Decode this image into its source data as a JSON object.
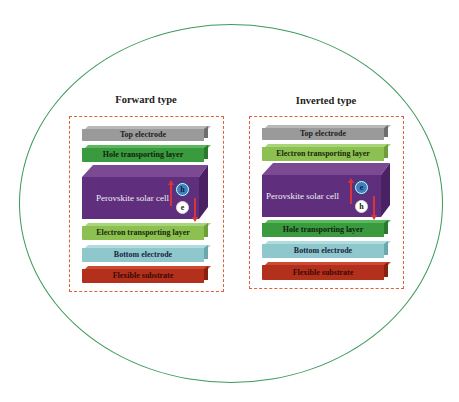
{
  "diagram": {
    "columns": [
      {
        "title": "Forward type",
        "layers": [
          {
            "label": "Top electrode",
            "color": "#9a9a9a",
            "text_color": "#1e1e1e"
          },
          {
            "label": "Hole transporting layer",
            "color": "#3a9a3e",
            "text_color": "#0f1f0f"
          },
          {
            "label": "Perovskite solar cell",
            "color": "#5f2e7c",
            "text_color": "#f2eef5",
            "carriers": [
              {
                "symbol": "h",
                "style": "blue"
              },
              {
                "symbol": "e",
                "style": "white"
              }
            ]
          },
          {
            "label": "Electron transporting layer",
            "color": "#8cc152",
            "text_color": "#1a2a0a"
          },
          {
            "label": "Bottom electrode",
            "color": "#8ec8cc",
            "text_color": "#1a2540"
          },
          {
            "label": "Flexible substrate",
            "color": "#b3301c",
            "text_color": "#3a0a05"
          }
        ]
      },
      {
        "title": "Inverted type",
        "layers": [
          {
            "label": "Top electrode",
            "color": "#9a9a9a",
            "text_color": "#1e1e1e"
          },
          {
            "label": "Electron transporting layer",
            "color": "#8cc152",
            "text_color": "#1a2a0a"
          },
          {
            "label": "Perovskite solar cell",
            "color": "#5f2e7c",
            "text_color": "#f2eef5",
            "carriers": [
              {
                "symbol": "e",
                "style": "blue"
              },
              {
                "symbol": "h",
                "style": "white"
              }
            ]
          },
          {
            "label": "Hole transporting layer",
            "color": "#3a9a3e",
            "text_color": "#0f1f0f"
          },
          {
            "label": "Bottom electrode",
            "color": "#8ec8cc",
            "text_color": "#1a2540"
          },
          {
            "label": "Flexible substrate",
            "color": "#b3301c",
            "text_color": "#3a0a05"
          }
        ]
      }
    ],
    "colors": {
      "outline_ellipse": "#3d9a5a",
      "dashed_box": "#e0603c",
      "arrow": "#d9343a"
    }
  }
}
